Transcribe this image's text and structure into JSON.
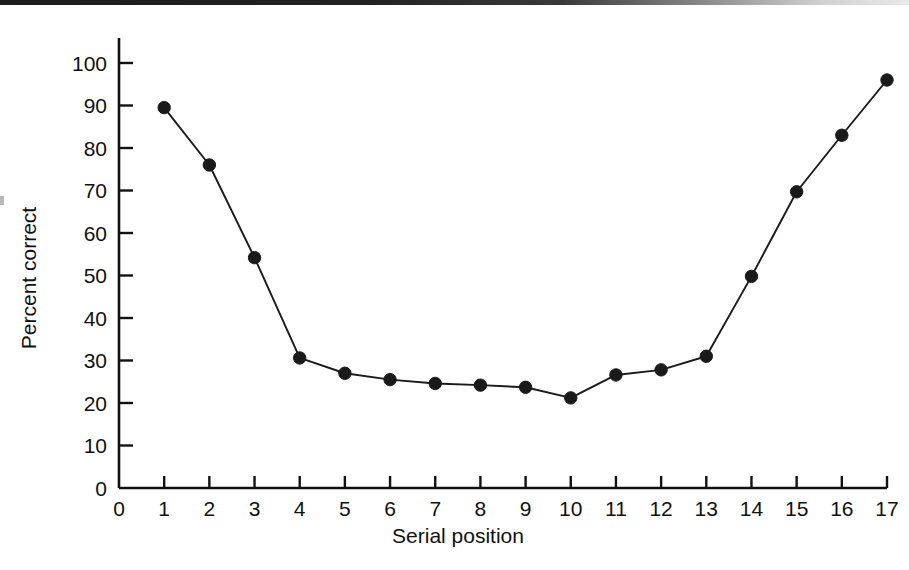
{
  "chart_data": {
    "type": "line",
    "title": "",
    "subtitle": "",
    "xlabel": "Serial position",
    "ylabel": "Percent correct",
    "x": [
      1,
      2,
      3,
      4,
      5,
      6,
      7,
      8,
      9,
      10,
      11,
      12,
      13,
      14,
      15,
      16,
      17
    ],
    "values": [
      89.5,
      76.0,
      54.2,
      30.6,
      27.0,
      25.5,
      24.6,
      24.2,
      23.7,
      21.2,
      26.6,
      27.8,
      31.0,
      49.8,
      69.7,
      83.0,
      96.0
    ],
    "series": [
      {
        "name": "Percent correct",
        "values": [
          89.5,
          76.0,
          54.2,
          30.6,
          27.0,
          25.5,
          24.6,
          24.2,
          23.7,
          21.2,
          26.6,
          27.8,
          31.0,
          49.8,
          69.7,
          83.0,
          96.0
        ]
      }
    ],
    "xlim": [
      0,
      17
    ],
    "ylim": [
      0,
      100
    ],
    "xticks": [
      0,
      1,
      2,
      3,
      4,
      5,
      6,
      7,
      8,
      9,
      10,
      11,
      12,
      13,
      14,
      15,
      16,
      17
    ],
    "yticks": [
      0,
      10,
      20,
      30,
      40,
      50,
      60,
      70,
      80,
      90,
      100
    ],
    "xtick_labels": [
      "0",
      "1",
      "2",
      "3",
      "4",
      "5",
      "6",
      "7",
      "8",
      "9",
      "10",
      "11",
      "12",
      "13",
      "14",
      "15",
      "16",
      "17"
    ],
    "ytick_labels": [
      "0",
      "10",
      "20",
      "30",
      "40",
      "50",
      "60",
      "70",
      "80",
      "90",
      "100"
    ],
    "grid": false,
    "legend": false,
    "legend_position": "none",
    "marker": "filled-circle",
    "line_color": "#1a1a1a",
    "marker_color": "#1a1a1a",
    "background_color": "#ffffff",
    "axis_color": "#111111"
  },
  "figure": {
    "background_color": "#ffffff"
  }
}
